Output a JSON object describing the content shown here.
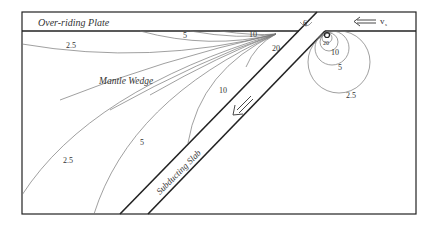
{
  "diagram": {
    "title_regions": {
      "overriding_plate": "Over-riding Plate",
      "mantle_wedge": "Mantle Wedge",
      "subducting_slab": "Subducting Slab"
    },
    "velocity_label": "v",
    "velocity_subscript": "s",
    "contour_labels": {
      "wedge_left_2_5_top": "2.5",
      "wedge_top_5": "5",
      "wedge_top_10": "10",
      "wedge_20": "20",
      "wedge_10": "10",
      "wedge_5": "5",
      "wedge_2_5": "2.5",
      "plate_6": "6",
      "circle_20": "20",
      "circle_10": "10",
      "circle_5": "5",
      "circle_2_5": "2.5"
    },
    "colors": {
      "outline": "#222222",
      "contour": "#666666",
      "text": "#333333"
    }
  }
}
